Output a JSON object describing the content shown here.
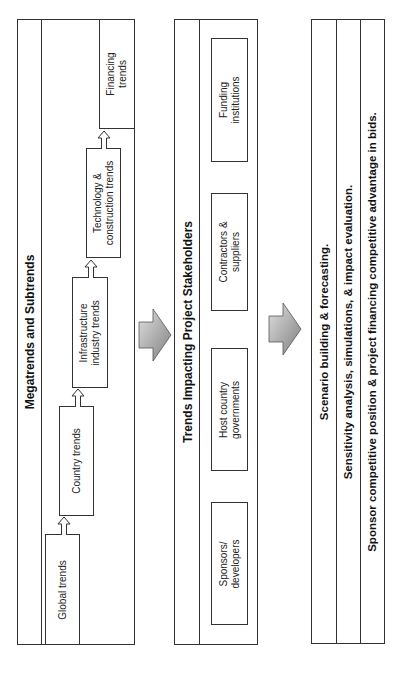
{
  "panels": [
    {
      "title": "Megatrends and Subtrends",
      "items": [
        {
          "label_line1": "Global trends",
          "label_line2": ""
        },
        {
          "label_line1": "Country trends",
          "label_line2": ""
        },
        {
          "label_line1": "Infrastructure",
          "label_line2": "industry trends"
        },
        {
          "label_line1": "Technology &",
          "label_line2": "construction trends"
        },
        {
          "label_line1": "Financing",
          "label_line2": "trends"
        }
      ]
    },
    {
      "title": "Trends Impacting Project Stakeholders",
      "items": [
        {
          "label_line1": "Sponsors/",
          "label_line2": "developers"
        },
        {
          "label_line1": "Host country",
          "label_line2": "governments"
        },
        {
          "label_line1": "Contractors &",
          "label_line2": "suppliers"
        },
        {
          "label_line1": "Funding",
          "label_line2": "institutions"
        }
      ]
    },
    {
      "rows": [
        "Scenario building & forecasting.",
        "Sensitivity analysis, simulations, & impact evaluation.",
        "Sponsor competitive position & project financing competitive advantage in bids."
      ]
    }
  ],
  "connectors": {
    "between_panels": [
      "right-arrow",
      "right-arrow"
    ],
    "within_panel_1": [
      "hollow-up-arrow",
      "hollow-up-arrow",
      "hollow-up-arrow",
      "hollow-up-arrow"
    ]
  },
  "colors": {
    "stroke": "#333333",
    "arrow_fill_light": "#d9d9d9",
    "arrow_fill_dark": "#8c8c8c"
  }
}
